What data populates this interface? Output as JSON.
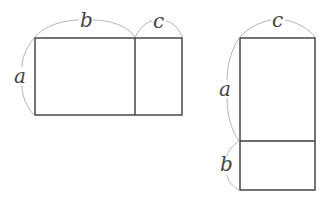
{
  "figures": [
    {
      "name": "horizontal-split-rectangle",
      "labels": {
        "height": "a",
        "left_width": "b",
        "right_width": "c"
      },
      "rect": {
        "x": 35,
        "y": 38,
        "w": 147,
        "h": 77
      },
      "divider_x": 135
    },
    {
      "name": "vertical-split-rectangle",
      "labels": {
        "width": "c",
        "top_height": "a",
        "bottom_height": "b"
      },
      "rect": {
        "x": 240,
        "y": 38,
        "w": 75,
        "h": 152
      },
      "divider_y": 141
    }
  ],
  "colors": {
    "stroke": "#3a3a3a",
    "brace": "#b5b5b5",
    "label": "#444444"
  }
}
